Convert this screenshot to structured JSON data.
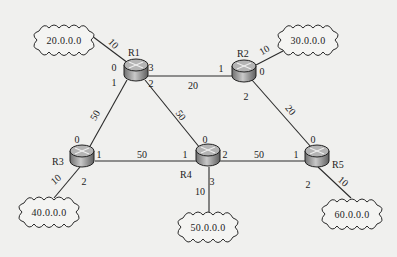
{
  "diagram": {
    "type": "network-topology",
    "routers": [
      {
        "id": "R1",
        "label": "R1",
        "x": 136,
        "y": 70,
        "label_pos": [
          128,
          56
        ]
      },
      {
        "id": "R2",
        "label": "R2",
        "x": 244,
        "y": 71,
        "label_pos": [
          237,
          57
        ]
      },
      {
        "id": "R3",
        "label": "R3",
        "x": 82,
        "y": 156,
        "label_pos": [
          52,
          165
        ]
      },
      {
        "id": "R4",
        "label": "R4",
        "x": 208,
        "y": 155,
        "label_pos": [
          180,
          178
        ]
      },
      {
        "id": "R5",
        "label": "R5",
        "x": 317,
        "y": 156,
        "label_pos": [
          332,
          168
        ]
      }
    ],
    "networks": [
      {
        "id": "n20",
        "label": "20.0.0.0",
        "x": 64,
        "y": 40,
        "w": 58,
        "h": 30
      },
      {
        "id": "n30",
        "label": "30.0.0.0",
        "x": 308,
        "y": 40,
        "w": 58,
        "h": 30
      },
      {
        "id": "n40",
        "label": "40.0.0.0",
        "x": 49,
        "y": 212,
        "w": 58,
        "h": 30
      },
      {
        "id": "n50",
        "label": "50.0.0.0",
        "x": 208,
        "y": 227,
        "w": 58,
        "h": 30
      },
      {
        "id": "n60",
        "label": "60.0.0.0",
        "x": 352,
        "y": 214,
        "w": 58,
        "h": 30
      }
    ],
    "links": [
      {
        "from": "R1",
        "to": "n20",
        "x1": 128,
        "y1": 63,
        "x2": 92,
        "y2": 36,
        "cost": "10",
        "cost_pos": [
          111,
          46
        ],
        "rot": 45
      },
      {
        "from": "R1",
        "to": "R2",
        "x1": 148,
        "y1": 76,
        "x2": 232,
        "y2": 76,
        "cost": "20",
        "cost_pos": [
          193,
          89
        ],
        "rot": 0
      },
      {
        "from": "R1",
        "to": "R3",
        "x1": 127,
        "y1": 80,
        "x2": 89,
        "y2": 148,
        "cost": "50",
        "cost_pos": [
          98,
          117
        ],
        "rot": -60
      },
      {
        "from": "R1",
        "to": "R4",
        "x1": 145,
        "y1": 80,
        "x2": 200,
        "y2": 148,
        "cost": "50",
        "cost_pos": [
          178,
          117
        ],
        "rot": 55
      },
      {
        "from": "R2",
        "to": "n30",
        "x1": 256,
        "y1": 65,
        "x2": 283,
        "y2": 51,
        "cost": "10",
        "cost_pos": [
          266,
          53
        ],
        "rot": -30
      },
      {
        "from": "R2",
        "to": "R5",
        "x1": 252,
        "y1": 80,
        "x2": 311,
        "y2": 147,
        "cost": "20",
        "cost_pos": [
          288,
          112
        ],
        "rot": 50
      },
      {
        "from": "R3",
        "to": "R4",
        "x1": 95,
        "y1": 161,
        "x2": 196,
        "y2": 161,
        "cost": "50",
        "cost_pos": [
          142,
          158
        ],
        "rot": 0
      },
      {
        "from": "R4",
        "to": "R5",
        "x1": 220,
        "y1": 161,
        "x2": 305,
        "y2": 161,
        "cost": "50",
        "cost_pos": [
          259,
          158
        ],
        "rot": 0
      },
      {
        "from": "R3",
        "to": "n40",
        "x1": 80,
        "y1": 167,
        "x2": 54,
        "y2": 198,
        "cost": "10",
        "cost_pos": [
          58,
          182
        ],
        "rot": -40
      },
      {
        "from": "R4",
        "to": "n50",
        "x1": 209,
        "y1": 167,
        "x2": 209,
        "y2": 213,
        "cost": "10",
        "cost_pos": [
          200,
          195
        ],
        "rot": 0
      },
      {
        "from": "R5",
        "to": "n60",
        "x1": 318,
        "y1": 167,
        "x2": 351,
        "y2": 198,
        "cost": "10",
        "cost_pos": [
          341,
          184
        ],
        "rot": 40
      }
    ],
    "ports": [
      {
        "router": "R1",
        "port": "0",
        "x": 114,
        "y": 71
      },
      {
        "router": "R1",
        "port": "3",
        "x": 151,
        "y": 71
      },
      {
        "router": "R1",
        "port": "1",
        "x": 114,
        "y": 86
      },
      {
        "router": "R1",
        "port": "2",
        "x": 151,
        "y": 87
      },
      {
        "router": "R2",
        "port": "1",
        "x": 221,
        "y": 72
      },
      {
        "router": "R2",
        "port": "0",
        "x": 262,
        "y": 75
      },
      {
        "router": "R2",
        "port": "2",
        "x": 246,
        "y": 100
      },
      {
        "router": "R3",
        "port": "0",
        "x": 77,
        "y": 143
      },
      {
        "router": "R3",
        "port": "1",
        "x": 99,
        "y": 158
      },
      {
        "router": "R3",
        "port": "2",
        "x": 84,
        "y": 185
      },
      {
        "router": "R4",
        "port": "0",
        "x": 205,
        "y": 143
      },
      {
        "router": "R4",
        "port": "1",
        "x": 185,
        "y": 158
      },
      {
        "router": "R4",
        "port": "2",
        "x": 225,
        "y": 158
      },
      {
        "router": "R4",
        "port": "3",
        "x": 212,
        "y": 185
      },
      {
        "router": "R5",
        "port": "0",
        "x": 313,
        "y": 143
      },
      {
        "router": "R5",
        "port": "1",
        "x": 296,
        "y": 158
      },
      {
        "router": "R5",
        "port": "2",
        "x": 308,
        "y": 188
      }
    ]
  },
  "colors": {
    "background": "#f0f0ee",
    "line": "#2a2a2a",
    "router_top": "#b9b9b9",
    "router_side": "#8e8e8e",
    "text": "#222222"
  }
}
